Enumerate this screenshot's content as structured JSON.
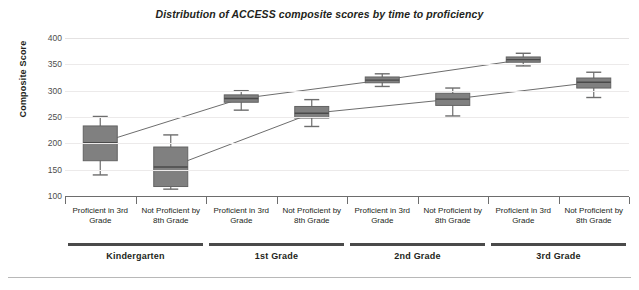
{
  "chart_data": {
    "type": "box",
    "title": "Distribution of ACCESS composite scores by time to proficiency",
    "xlabel": "",
    "ylabel": "Composite Score",
    "ylim": [
      100,
      400
    ],
    "yticks": [
      400,
      350,
      300,
      250,
      200,
      150,
      100
    ],
    "grid": true,
    "legend_position": "none",
    "groups": [
      "Kindergarten",
      "1st Grade",
      "2nd Grade",
      "3rd Grade"
    ],
    "categories": [
      "Proficient in 3rd Grade",
      "Not Proficient by 8th Grade",
      "Proficient in 3rd Grade",
      "Not Proficient by 8th Grade",
      "Proficient in 3rd Grade",
      "Not Proficient by 8th Grade",
      "Proficient in 3rd Grade",
      "Not Proficient by 8th Grade"
    ],
    "boxes": [
      {
        "group": "Kindergarten",
        "category": "Proficient in 3rd Grade",
        "whisker_low": 140,
        "q1": 167,
        "median": 201,
        "q3": 233,
        "whisker_high": 251
      },
      {
        "group": "Kindergarten",
        "category": "Not Proficient by 8th Grade",
        "whisker_low": 113,
        "q1": 118,
        "median": 155,
        "q3": 193,
        "whisker_high": 216
      },
      {
        "group": "1st Grade",
        "category": "Proficient in 3rd Grade",
        "whisker_low": 263,
        "q1": 278,
        "median": 285,
        "q3": 292,
        "whisker_high": 300
      },
      {
        "group": "1st Grade",
        "category": "Not Proficient by 8th Grade",
        "whisker_low": 232,
        "q1": 248,
        "median": 257,
        "q3": 270,
        "whisker_high": 283
      },
      {
        "group": "2nd Grade",
        "category": "Proficient in 3rd Grade",
        "whisker_low": 308,
        "q1": 315,
        "median": 320,
        "q3": 326,
        "whisker_high": 332
      },
      {
        "group": "2nd Grade",
        "category": "Not Proficient by 8th Grade",
        "whisker_low": 252,
        "q1": 272,
        "median": 284,
        "q3": 295,
        "whisker_high": 305
      },
      {
        "group": "3rd Grade",
        "category": "Proficient in 3rd Grade",
        "whisker_low": 347,
        "q1": 354,
        "median": 359,
        "q3": 364,
        "whisker_high": 371
      },
      {
        "group": "3rd Grade",
        "category": "Not Proficient by 8th Grade",
        "whisker_low": 287,
        "q1": 305,
        "median": 316,
        "q3": 324,
        "whisker_high": 335
      }
    ],
    "trend_lines": [
      {
        "name": "Proficient in 3rd Grade",
        "values": [
          201,
          285,
          320,
          359
        ]
      },
      {
        "name": "Not Proficient by 8th Grade",
        "values": [
          155,
          257,
          284,
          316
        ]
      }
    ],
    "colors": {
      "box_fill": "#808080",
      "box_stroke": "#636363",
      "median": "#4a4a4a",
      "whisker": "#6d6d6d",
      "trend_line": "#6d6d6d",
      "grid": "#eceaea",
      "axis": "#6d6d6d",
      "text": "#231f20"
    }
  }
}
